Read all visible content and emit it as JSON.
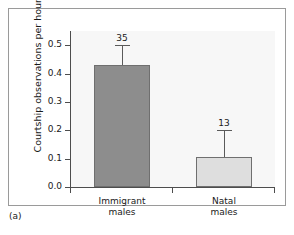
{
  "caption": "(a)",
  "chart_data": {
    "type": "bar",
    "title": "",
    "xlabel": "",
    "ylabel": "Courtship observations per hour",
    "categories": [
      "Immigrant males",
      "Natal males"
    ],
    "category_lines": [
      [
        "Immigrant",
        "males"
      ],
      [
        "Natal",
        "males"
      ]
    ],
    "values": [
      0.43,
      0.107
    ],
    "error_upper": [
      0.5,
      0.2
    ],
    "point_labels": [
      "35",
      "13"
    ],
    "bar_colors": [
      "#8d8d8d",
      "#dedede"
    ],
    "bar_edge_color": "#6f6f6f",
    "ylim": [
      0.0,
      0.55
    ],
    "yticks": [
      0.0,
      0.1,
      0.2,
      0.3,
      0.4,
      0.5
    ],
    "ytick_labels": [
      "0.0",
      "0.1",
      "0.2",
      "0.3",
      "0.4",
      "0.5"
    ],
    "grid": false,
    "legend": "none",
    "plot_background": "#f7f7f7",
    "axis_color": "#4d4d4d"
  }
}
